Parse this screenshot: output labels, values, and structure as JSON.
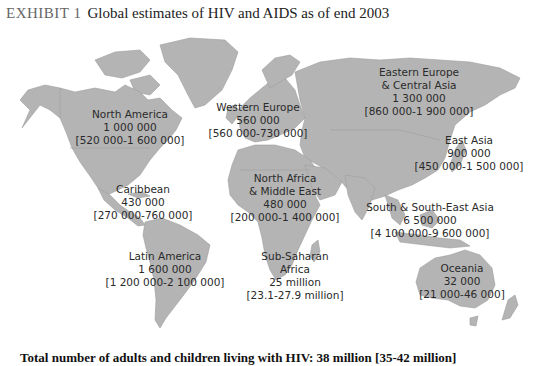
{
  "title": {
    "exhibit": "EXHIBIT 1",
    "text": "Global estimates of HIV and AIDS as of end 2003"
  },
  "regions": [
    {
      "name": "North America",
      "name_line2": "",
      "estimate": "1 000 000",
      "range": "[520 000-1 600 000]"
    },
    {
      "name": "Western Europe",
      "name_line2": "",
      "estimate": "560 000",
      "range": "[560 000-730 000]"
    },
    {
      "name": "Eastern Europe",
      "name_line2": "& Central Asia",
      "estimate": "1 300 000",
      "range": "[860 000-1 900 000]"
    },
    {
      "name": "East Asia",
      "name_line2": "",
      "estimate": "900 000",
      "range": "[450 000-1 500 000]"
    },
    {
      "name": "Caribbean",
      "name_line2": "",
      "estimate": "430 000",
      "range": "[270 000-760 000]"
    },
    {
      "name": "North Africa",
      "name_line2": "& Middle East",
      "estimate": "480 000",
      "range": "[200 000-1 400 000]"
    },
    {
      "name": "South & South-East Asia",
      "name_line2": "",
      "estimate": "6 500 000",
      "range": "[4 100 000-9 600 000]"
    },
    {
      "name": "Latin America",
      "name_line2": "",
      "estimate": "1 600 000",
      "range": "[1 200 000-2 100 000]"
    },
    {
      "name": "Sub-Saharan",
      "name_line2": "Africa",
      "estimate": "25 million",
      "range": "[23.1-27.9 million]"
    },
    {
      "name": "Oceania",
      "name_line2": "",
      "estimate": "32 000",
      "range": "[21 000-46 000]"
    }
  ],
  "footer": {
    "text": "Total number of adults and children living with HIV: 38 million [35-42 million]"
  },
  "colors": {
    "land": "#b4b4b4",
    "background": "#ffffff",
    "text": "#2a2a2a"
  }
}
